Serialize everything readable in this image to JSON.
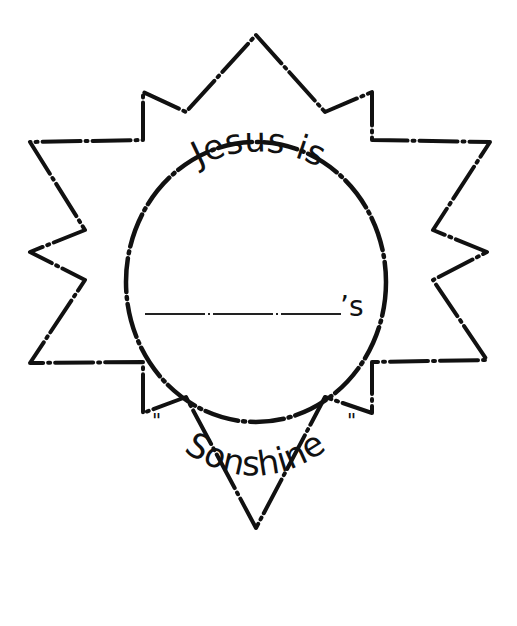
{
  "worksheet": {
    "top_text": "Jesus is",
    "blank_suffix": "’s",
    "bottom_text": "Sonshine",
    "open_quote": "\"",
    "close_quote": "\"",
    "ink_color": "#111111",
    "background_color": "#ffffff"
  }
}
